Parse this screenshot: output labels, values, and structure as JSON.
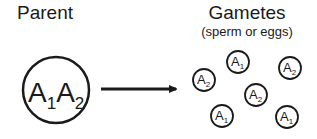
{
  "parent": {
    "label": "Parent",
    "genotype": [
      {
        "allele": "A",
        "sub": "1"
      },
      {
        "allele": "A",
        "sub": "2"
      }
    ]
  },
  "gametes": {
    "label": "Gametes",
    "sublabel": "(sperm or eggs)",
    "items": [
      {
        "allele": "A",
        "sub": "1",
        "cx": 238,
        "cy": 62
      },
      {
        "allele": "A",
        "sub": "2",
        "cx": 290,
        "cy": 68
      },
      {
        "allele": "A",
        "sub": "2",
        "cx": 204,
        "cy": 80
      },
      {
        "allele": "A",
        "sub": "2",
        "cx": 256,
        "cy": 95
      },
      {
        "allele": "A",
        "sub": "1",
        "cx": 222,
        "cy": 116
      },
      {
        "allele": "A",
        "sub": "1",
        "cx": 287,
        "cy": 117
      }
    ]
  },
  "colors": {
    "stroke": "#1a1a1a",
    "background": "#ffffff"
  }
}
